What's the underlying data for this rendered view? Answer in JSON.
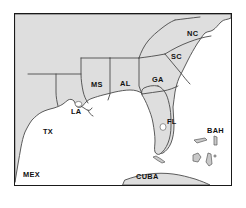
{
  "figure": {
    "kind": "reference-map",
    "frame": {
      "border_color": "#1a1a1a",
      "background": "#ffffff"
    }
  },
  "colors": {
    "land_fill": "#dedede",
    "land_outline": "#4a4a4a",
    "water_fill": "#ffffff",
    "label_text": "#111111",
    "island_fill": "#c9c9c9",
    "frame_border": "#1a1a1a"
  },
  "labels": {
    "us_states": [
      {
        "code": "TX",
        "name": "Texas",
        "x": 28,
        "y": 120
      },
      {
        "code": "LA",
        "name": "Louisiana",
        "x": 56,
        "y": 100
      },
      {
        "code": "MS",
        "name": "Mississippi",
        "x": 83,
        "y": 73
      },
      {
        "code": "AL",
        "name": "Alabama",
        "x": 112,
        "y": 72
      },
      {
        "code": "GA",
        "name": "Georgia",
        "x": 143,
        "y": 68
      },
      {
        "code": "FL",
        "name": "Florida",
        "x": 161,
        "y": 110
      },
      {
        "code": "SC",
        "name": "South Carolina",
        "x": 162,
        "y": 45
      },
      {
        "code": "NC",
        "name": "North Carolina",
        "x": 178,
        "y": 22
      }
    ],
    "countries": [
      {
        "code": "MEX",
        "name": "Mexico",
        "x": 12,
        "y": 163
      },
      {
        "code": "CUBA",
        "name": "Cuba",
        "x": 128,
        "y": 165
      },
      {
        "code": "BAH",
        "name": "Bahamas",
        "x": 200,
        "y": 119
      }
    ]
  }
}
